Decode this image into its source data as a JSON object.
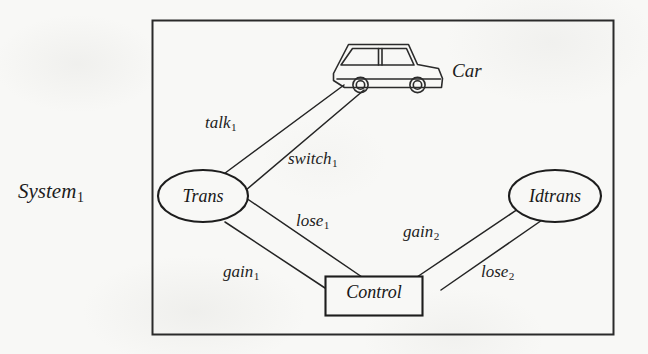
{
  "figure": {
    "system_label": "System",
    "system_subscript": "1",
    "background_color": "#f8f8f6",
    "ink_color": "#1d1d1d"
  },
  "nodes": [
    {
      "id": "car",
      "label": "Car",
      "shape": "icon",
      "icon": "car-icon"
    },
    {
      "id": "trans",
      "label": "Trans",
      "shape": "ellipse"
    },
    {
      "id": "idtrans",
      "label": "Idtrans",
      "shape": "ellipse"
    },
    {
      "id": "control",
      "label": "Control",
      "shape": "rectangle"
    }
  ],
  "edges": [
    {
      "id": "talk1",
      "label": "talk",
      "subscript": "1",
      "from": "car",
      "to": "trans"
    },
    {
      "id": "switch1",
      "label": "switch",
      "subscript": "1",
      "from": "car",
      "to": "trans"
    },
    {
      "id": "lose1",
      "label": "lose",
      "subscript": "1",
      "from": "trans",
      "to": "control"
    },
    {
      "id": "gain1",
      "label": "gain",
      "subscript": "1",
      "from": "trans",
      "to": "control"
    },
    {
      "id": "gain2",
      "label": "gain",
      "subscript": "2",
      "from": "idtrans",
      "to": "control"
    },
    {
      "id": "lose2",
      "label": "lose",
      "subscript": "2",
      "from": "idtrans",
      "to": "control"
    }
  ]
}
